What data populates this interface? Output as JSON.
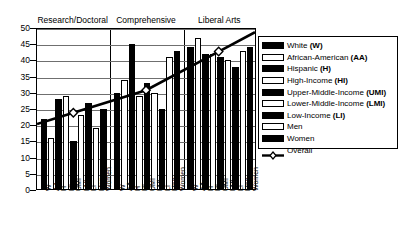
{
  "chart_data": {
    "type": "bar",
    "title": "",
    "xlabel": "",
    "ylabel": "",
    "ylim": [
      0,
      50
    ],
    "yticks": [
      0,
      5,
      10,
      15,
      20,
      25,
      30,
      35,
      40,
      45,
      50
    ],
    "grid": true,
    "legend_position": "right",
    "groups": [
      "Research/Doctoral",
      "Comprehensive",
      "Liberal Arts"
    ],
    "categories": [
      "W",
      "AA",
      "H",
      "HI",
      "UMI",
      "LMI",
      "LI",
      "Men",
      "Women"
    ],
    "series": [
      {
        "name": "Research/Doctoral",
        "values": [
          22,
          16,
          28,
          29,
          15,
          23,
          27,
          19,
          25
        ]
      },
      {
        "name": "Comprehensive",
        "values": [
          30,
          34,
          45,
          29,
          33,
          30,
          25,
          41,
          43
        ]
      },
      {
        "name": "Liberal Arts",
        "values": [
          44,
          47,
          42,
          42,
          41,
          40,
          38,
          43,
          44
        ]
      }
    ],
    "overall_line": {
      "name": "Overall",
      "marker": "diamond",
      "values": [
        24,
        31,
        43
      ]
    }
  },
  "axis": {
    "y_tick_labels": [
      "50",
      "45",
      "40",
      "35",
      "30",
      "25",
      "20",
      "15",
      "10",
      "5",
      "0"
    ]
  },
  "group_headers": [
    {
      "label": "Research/Doctoral"
    },
    {
      "label": "Comprehensive"
    },
    {
      "label": "Liberal Arts"
    }
  ],
  "x_tick_labels": [
    "W",
    "AA",
    "H",
    "HI",
    "UMI",
    "LMI",
    "LI",
    "Men",
    "Women"
  ],
  "legend": {
    "items": [
      {
        "label": "White (W)",
        "swatch": "dark"
      },
      {
        "label": "African-American (AA)",
        "swatch": "light"
      },
      {
        "label": "Hispanic (H)",
        "swatch": "dark"
      },
      {
        "label": "High-Income (HI)",
        "swatch": "light"
      },
      {
        "label": "Upper-Middle-Income (UMI)",
        "swatch": "dark"
      },
      {
        "label": "Lower-Middle-Income (LMI)",
        "swatch": "light"
      },
      {
        "label": "Low-Income (LI)",
        "swatch": "dark"
      },
      {
        "label": "Men",
        "swatch": "light"
      },
      {
        "label": "Women",
        "swatch": "dark"
      },
      {
        "label": "Overall",
        "swatch": "line"
      }
    ]
  },
  "colors": {
    "dark_bar": "#000000",
    "light_bar": "#ffffff",
    "gridline": "#6f6f6f",
    "axis": "#000000",
    "background": "#ffffff"
  }
}
